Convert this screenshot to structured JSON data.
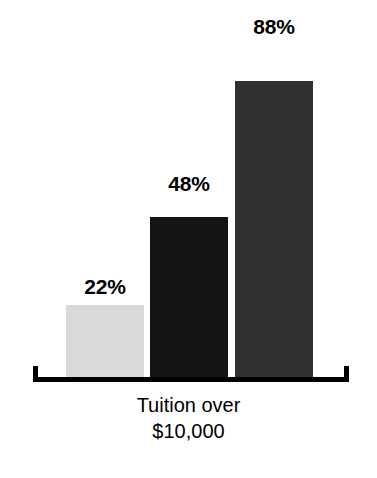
{
  "chart_data": {
    "type": "bar",
    "title": "",
    "subtitle": "",
    "xlabel": "Tuition over $10,000",
    "ylabel": "",
    "ylim": [
      0,
      100
    ],
    "grid": false,
    "legend": "none",
    "categories": [
      "22%",
      "48%",
      "88%"
    ],
    "values": [
      22,
      48,
      88
    ],
    "data_labels": [
      "22%",
      "48%",
      "88%"
    ],
    "series": [
      {
        "name": "Tuition over $10,000",
        "values": [
          22,
          48,
          88
        ]
      }
    ],
    "bars": [
      {
        "label": "22%",
        "value": 22,
        "color": "#d9d9d9"
      },
      {
        "label": "48%",
        "value": 48,
        "color": "#141414"
      },
      {
        "label": "88%",
        "value": 88,
        "color": "#303030"
      }
    ],
    "axis": {
      "caption_lines": [
        "Tuition over",
        "$10,000"
      ],
      "baseline_style": "bracket",
      "baseline_color": "#000000"
    }
  }
}
